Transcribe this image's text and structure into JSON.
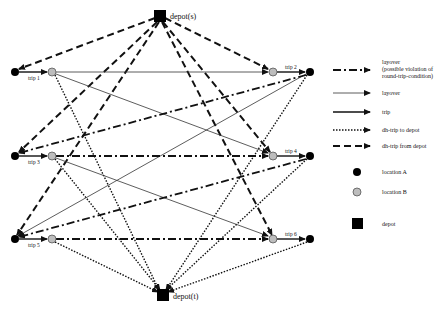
{
  "nodes": {
    "depot_s": {
      "label": "depot(s)",
      "x": 160,
      "y": 16
    },
    "depot_t": {
      "label": "depot(t)",
      "x": 163,
      "y": 295
    },
    "trips": [
      {
        "label": "trip 1",
        "a": [
          15,
          72
        ],
        "b": [
          52,
          72
        ]
      },
      {
        "label": "trip 2",
        "a": [
          310,
          72
        ],
        "b": [
          273,
          72
        ]
      },
      {
        "label": "trip 3",
        "a": [
          15,
          156
        ],
        "b": [
          52,
          156
        ]
      },
      {
        "label": "trip 4",
        "a": [
          310,
          156
        ],
        "b": [
          273,
          156
        ]
      },
      {
        "label": "trip 5",
        "a": [
          15,
          239
        ],
        "b": [
          52,
          239
        ]
      },
      {
        "label": "trip 6",
        "a": [
          310,
          239
        ],
        "b": [
          273,
          239
        ]
      }
    ]
  },
  "legend": {
    "items": [
      {
        "style": "dashdot",
        "label": "layover",
        "sublabel1": "(possible violation of",
        "sublabel2": "round-trip-condition)"
      },
      {
        "style": "thin",
        "label": "layover"
      },
      {
        "style": "solid",
        "label": "trip"
      },
      {
        "style": "dotted",
        "label": "dh-trip to depot"
      },
      {
        "style": "dashed",
        "label": "dh-trip from depot"
      },
      {
        "style": "locA",
        "label": "location A"
      },
      {
        "style": "locB",
        "label": "location B"
      },
      {
        "style": "depot",
        "label": "depot"
      }
    ]
  },
  "colors": {
    "locationA": "#000000",
    "locationB": "#bdbdbd",
    "line": "#111111"
  }
}
